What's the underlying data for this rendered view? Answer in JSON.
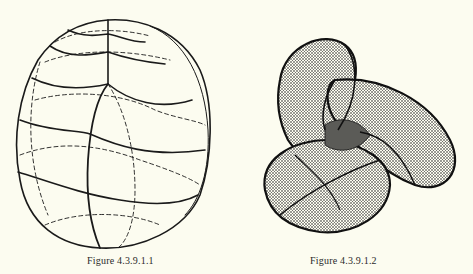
{
  "figures": [
    {
      "caption": "Figure 4.3.9.1.1",
      "description": "egg-shaped surface drawn with solid and dashed grid curves"
    },
    {
      "caption": "Figure 4.3.9.1.2",
      "description": "three-lobed mesh surface (Boy-like surface) rendered with dense hatching"
    }
  ],
  "colors": {
    "background": "#fcfcf0",
    "ink": "#1a1a1a"
  }
}
